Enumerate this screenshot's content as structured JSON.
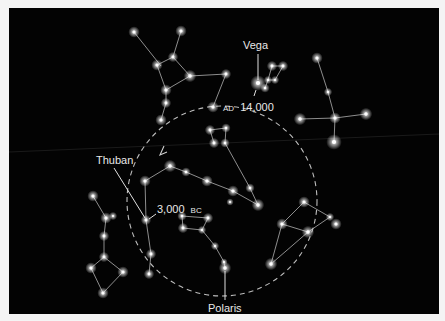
{
  "diagram": {
    "colors": {
      "sky": "#030303",
      "border": "#f4f4f4",
      "line": "#cfcfcf",
      "star": "#ffffff",
      "label": "#e8e8e8"
    },
    "labels": {
      "vega": "Vega",
      "thuban": "Thuban",
      "polaris": "Polaris",
      "ad_era": "AD",
      "ad_year": "14,000",
      "bc_year": "3,000",
      "bc_era": "BC"
    },
    "precession_circle": {
      "cx": 222,
      "cy": 201,
      "r": 95,
      "style": "dashed",
      "direction_arrow": "counterclockwise"
    },
    "stars": [
      [
        134,
        32,
        2.2
      ],
      [
        181,
        31,
        2.2
      ],
      [
        157,
        65,
        2.2
      ],
      [
        173,
        57,
        2
      ],
      [
        190,
        76,
        2.4
      ],
      [
        166,
        90,
        2.2
      ],
      [
        166,
        103,
        2
      ],
      [
        161,
        120,
        2.2
      ],
      [
        226,
        74,
        2
      ],
      [
        213,
        107,
        2.2
      ],
      [
        258,
        83,
        3
      ],
      [
        272,
        66,
        2
      ],
      [
        283,
        66,
        2
      ],
      [
        265,
        88,
        1.8
      ],
      [
        275,
        80,
        1.6
      ],
      [
        268,
        80,
        1.6
      ],
      [
        317,
        58,
        2.2
      ],
      [
        328,
        92,
        1.6
      ],
      [
        300,
        119,
        2.4
      ],
      [
        335,
        118,
        2.2
      ],
      [
        366,
        114,
        2.4
      ],
      [
        334,
        142,
        3
      ],
      [
        210,
        130,
        2
      ],
      [
        226,
        128,
        1.8
      ],
      [
        214,
        143,
        2
      ],
      [
        225,
        143,
        1.8
      ],
      [
        145,
        181,
        2.2
      ],
      [
        170,
        166,
        2.4
      ],
      [
        186,
        172,
        1.8
      ],
      [
        207,
        181,
        2.2
      ],
      [
        233,
        191,
        2.2
      ],
      [
        230,
        202,
        1.4
      ],
      [
        250,
        188,
        1.8
      ],
      [
        258,
        205,
        2.4
      ],
      [
        146,
        220,
        2
      ],
      [
        151,
        254,
        2
      ],
      [
        149,
        274,
        2
      ],
      [
        182,
        216,
        1.8
      ],
      [
        183,
        228,
        2
      ],
      [
        208,
        218,
        2
      ],
      [
        202,
        230,
        1.6
      ],
      [
        215,
        246,
        1.6
      ],
      [
        224,
        262,
        1.4
      ],
      [
        225,
        268,
        2.4
      ],
      [
        93,
        196,
        2.2
      ],
      [
        106,
        218,
        2.2
      ],
      [
        113,
        216,
        1.6
      ],
      [
        104,
        236,
        2
      ],
      [
        104,
        257,
        2
      ],
      [
        91,
        268,
        2.2
      ],
      [
        123,
        272,
        2.2
      ],
      [
        103,
        293,
        2.2
      ],
      [
        304,
        202,
        2.2
      ],
      [
        282,
        224,
        2.2
      ],
      [
        308,
        232,
        2.4
      ],
      [
        330,
        217,
        1.6
      ],
      [
        336,
        224,
        2.2
      ],
      [
        271,
        264,
        2.4
      ]
    ],
    "lines": [
      [
        134,
        32,
        161,
        66
      ],
      [
        181,
        31,
        173,
        57
      ],
      [
        157,
        65,
        173,
        57
      ],
      [
        173,
        57,
        190,
        76
      ],
      [
        157,
        65,
        166,
        90
      ],
      [
        190,
        76,
        166,
        90
      ],
      [
        166,
        90,
        166,
        103
      ],
      [
        166,
        103,
        161,
        120
      ],
      [
        190,
        76,
        226,
        74
      ],
      [
        226,
        74,
        213,
        107
      ],
      [
        268,
        80,
        272,
        66
      ],
      [
        272,
        66,
        283,
        66
      ],
      [
        283,
        66,
        275,
        80
      ],
      [
        275,
        80,
        268,
        80
      ],
      [
        268,
        80,
        265,
        88
      ],
      [
        317,
        58,
        328,
        92
      ],
      [
        328,
        92,
        335,
        118
      ],
      [
        300,
        119,
        335,
        118
      ],
      [
        335,
        118,
        366,
        114
      ],
      [
        335,
        118,
        334,
        142
      ],
      [
        210,
        130,
        226,
        128
      ],
      [
        226,
        128,
        225,
        143
      ],
      [
        210,
        130,
        214,
        143
      ],
      [
        225,
        143,
        250,
        188
      ],
      [
        250,
        188,
        258,
        205
      ],
      [
        145,
        181,
        170,
        166
      ],
      [
        170,
        166,
        186,
        172
      ],
      [
        186,
        172,
        207,
        181
      ],
      [
        207,
        181,
        233,
        191
      ],
      [
        233,
        191,
        258,
        205
      ],
      [
        145,
        181,
        146,
        220
      ],
      [
        146,
        220,
        151,
        254
      ],
      [
        151,
        254,
        149,
        274
      ],
      [
        182,
        216,
        208,
        218
      ],
      [
        182,
        216,
        183,
        228
      ],
      [
        183,
        228,
        202,
        230
      ],
      [
        208,
        218,
        202,
        230
      ],
      [
        202,
        230,
        215,
        246
      ],
      [
        215,
        246,
        224,
        262
      ],
      [
        224,
        262,
        225,
        268
      ],
      [
        93,
        196,
        106,
        218
      ],
      [
        106,
        218,
        104,
        236
      ],
      [
        104,
        236,
        104,
        257
      ],
      [
        104,
        257,
        91,
        268
      ],
      [
        91,
        268,
        103,
        293
      ],
      [
        103,
        293,
        123,
        272
      ],
      [
        123,
        272,
        104,
        257
      ],
      [
        304,
        202,
        282,
        224
      ],
      [
        304,
        202,
        330,
        217
      ],
      [
        282,
        224,
        308,
        232
      ],
      [
        330,
        217,
        308,
        232
      ],
      [
        282,
        224,
        271,
        264
      ],
      [
        308,
        232,
        271,
        264
      ]
    ],
    "pointers": [
      {
        "name": "vega-pointer",
        "x1": 258,
        "y1": 54,
        "x2": 258,
        "y2": 80
      },
      {
        "name": "ad14000-pointer",
        "x1": 254,
        "y1": 96,
        "x2": 256,
        "y2": 90
      },
      {
        "name": "thuban-pointer",
        "x1": 114,
        "y1": 168,
        "x2": 145,
        "y2": 218
      },
      {
        "name": "bc3000-pointer",
        "x1": 156,
        "y1": 214,
        "x2": 149,
        "y2": 219
      },
      {
        "name": "polaris-pointer",
        "x1": 225,
        "y1": 271,
        "x2": 225,
        "y2": 300
      }
    ]
  }
}
